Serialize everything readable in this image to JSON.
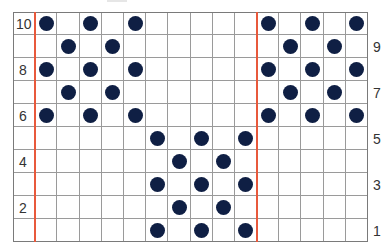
{
  "chart_data": {
    "type": "grid-pattern",
    "title": "",
    "rows": 10,
    "columns": 16,
    "row_labels_left": [
      "10",
      "8",
      "6",
      "4",
      "2"
    ],
    "row_labels_right": [
      "9",
      "7",
      "5",
      "3",
      "1"
    ],
    "red_lines_after_columns": [
      0,
      10
    ],
    "dots": {
      "10": [
        1,
        3,
        5,
        11,
        13,
        15
      ],
      "9": [
        2,
        4,
        12,
        14
      ],
      "8": [
        1,
        3,
        5,
        11,
        13,
        15
      ],
      "7": [
        2,
        4,
        12,
        14
      ],
      "6": [
        1,
        3,
        5,
        11,
        13,
        15
      ],
      "5": [
        6,
        8,
        10
      ],
      "4": [
        7,
        9
      ],
      "3": [
        6,
        8,
        10
      ],
      "2": [
        7,
        9
      ],
      "1": [
        6,
        8,
        10
      ]
    }
  },
  "colors": {
    "dot": "#0f1f44",
    "red_line": "#e8593c",
    "grid": "#9a9a9a"
  },
  "labels": {
    "left": [
      {
        "row": 10,
        "text": "10"
      },
      {
        "row": 8,
        "text": "8"
      },
      {
        "row": 6,
        "text": "6"
      },
      {
        "row": 4,
        "text": "4"
      },
      {
        "row": 2,
        "text": "2"
      }
    ],
    "right": [
      {
        "row": 9,
        "text": "9"
      },
      {
        "row": 7,
        "text": "7"
      },
      {
        "row": 5,
        "text": "5"
      },
      {
        "row": 3,
        "text": "3"
      },
      {
        "row": 1,
        "text": "1"
      }
    ]
  }
}
